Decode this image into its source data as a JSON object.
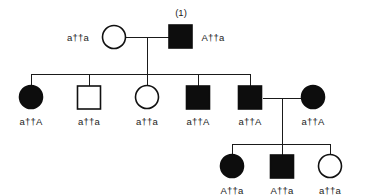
{
  "figure": {
    "type": "pedigree-chart",
    "background_color": "#ffffff",
    "line_color": "#1a1a1a",
    "filled_symbol_color": "#0d0d0d",
    "open_symbol_fill": "#ffffff",
    "chromosome_glyph": "†"
  },
  "annotations": {
    "proband_id": "(1)"
  },
  "generations": [
    {
      "id": "generation-1",
      "individuals": [
        {
          "id": "I-1",
          "sex": "female",
          "shape": "circle",
          "affected": false,
          "genotype": "a †† a",
          "allele_left": "a",
          "allele_right": "a",
          "label": "a††a"
        },
        {
          "id": "I-2",
          "sex": "male",
          "shape": "square",
          "affected": true,
          "genotype": "A †† a",
          "allele_left": "A",
          "allele_right": "a",
          "label": "A††a",
          "id_tag": "(1)"
        }
      ]
    },
    {
      "id": "generation-2",
      "individuals": [
        {
          "id": "II-1",
          "sex": "female",
          "shape": "circle",
          "affected": true,
          "genotype": "a †† A",
          "allele_left": "a",
          "allele_right": "A",
          "label": "a††A"
        },
        {
          "id": "II-2",
          "sex": "male",
          "shape": "square",
          "affected": false,
          "genotype": "a †† a",
          "allele_left": "a",
          "allele_right": "a",
          "label": "a††a"
        },
        {
          "id": "II-3",
          "sex": "female",
          "shape": "circle",
          "affected": false,
          "genotype": "a †† a",
          "allele_left": "a",
          "allele_right": "a",
          "label": "a††a"
        },
        {
          "id": "II-4",
          "sex": "male",
          "shape": "square",
          "affected": true,
          "genotype": "a †† A",
          "allele_left": "a",
          "allele_right": "A",
          "label": "a††A"
        },
        {
          "id": "II-5",
          "sex": "male",
          "shape": "square",
          "affected": true,
          "genotype": "a †† A",
          "allele_left": "a",
          "allele_right": "A",
          "label": "a††A"
        },
        {
          "id": "II-6",
          "sex": "female",
          "shape": "circle",
          "affected": true,
          "genotype": "a †† A",
          "allele_left": "a",
          "allele_right": "A",
          "label": "a††A"
        }
      ]
    },
    {
      "id": "generation-3",
      "individuals": [
        {
          "id": "III-1",
          "sex": "female",
          "shape": "circle",
          "affected": true,
          "genotype": "A †† a",
          "allele_left": "A",
          "allele_right": "a",
          "label": "A††a"
        },
        {
          "id": "III-2",
          "sex": "male",
          "shape": "square",
          "affected": true,
          "genotype": "A †† a",
          "allele_left": "A",
          "allele_right": "a",
          "label": "A††a"
        },
        {
          "id": "III-3",
          "sex": "female",
          "shape": "circle",
          "affected": false,
          "genotype": "a †† a",
          "allele_left": "a",
          "allele_right": "a",
          "label": "a††a"
        }
      ]
    }
  ]
}
